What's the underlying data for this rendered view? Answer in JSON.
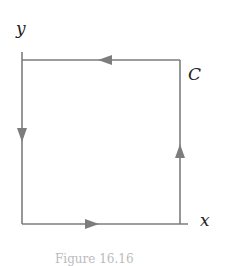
{
  "diagram": {
    "labels": {
      "y_axis": "y",
      "x_axis": "x",
      "curve": "C"
    },
    "curve_color": "#7a7a7a",
    "path": "square counterclockwise: right side up, top side left, left side down, bottom side right",
    "caption": "Figure 16.16"
  }
}
